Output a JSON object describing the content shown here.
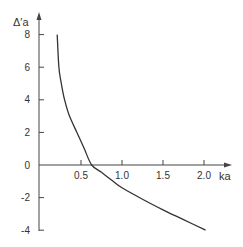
{
  "chart_data": {
    "type": "line",
    "title": "",
    "xlabel": "ka",
    "ylabel": "Δ′a",
    "xlim": [
      0,
      2.3
    ],
    "ylim": [
      -4,
      9
    ],
    "x_ticks": [
      0.5,
      1.0,
      1.5,
      2.0
    ],
    "x_tick_labels": [
      "0.5",
      "1.0",
      "1.5",
      "2.0"
    ],
    "y_ticks": [
      8,
      6,
      4,
      2,
      0,
      -2,
      -4
    ],
    "y_tick_labels": [
      "8",
      "6",
      "4",
      "2",
      "0",
      "-2",
      "-4"
    ],
    "grid": false,
    "legend": null,
    "series": [
      {
        "name": "Δ′a vs ka",
        "x": [
          0.21,
          0.23,
          0.26,
          0.3,
          0.36,
          0.45,
          0.54,
          0.63,
          0.75,
          0.88,
          1.0,
          1.25,
          1.5,
          1.75,
          2.02
        ],
        "y": [
          8.0,
          6.0,
          5.0,
          4.0,
          3.0,
          2.0,
          1.0,
          0.0,
          -0.45,
          -0.95,
          -1.4,
          -2.1,
          -2.75,
          -3.35,
          -4.0
        ]
      }
    ],
    "line_color": "#333333"
  },
  "axes": {
    "x_label": "ka",
    "y_label": "Δ′a"
  }
}
